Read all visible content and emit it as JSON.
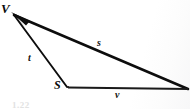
{
  "figure": {
    "type": "vector-triangle-diagram",
    "background_color": "#ffffff",
    "stroke_color": "#0d0d0d",
    "width": 190,
    "height": 109,
    "vertices": [
      {
        "name": "V",
        "label": "V",
        "x": 12,
        "y": 13
      },
      {
        "name": "S",
        "label": "S",
        "x": 67,
        "y": 87
      },
      {
        "name": "R",
        "label": "",
        "x": 188,
        "y": 89
      }
    ],
    "edges": [
      {
        "name": "edge-s",
        "label": "s",
        "from": "V",
        "to": "R",
        "arrow_at": "V",
        "stroke_width": 2.6
      },
      {
        "name": "edge-t",
        "label": "t",
        "from": "S",
        "to": "V",
        "arrow_at": "V",
        "stroke_width": 2.0
      },
      {
        "name": "edge-v",
        "label": "v",
        "from": "S",
        "to": "R",
        "arrow_at": "none",
        "stroke_width": 2.2
      }
    ],
    "labels": {
      "vertex_V": "V",
      "vertex_S": "S",
      "side_s": "s",
      "side_t": "t",
      "side_v": "v"
    },
    "caption_fragment": "1.22"
  }
}
